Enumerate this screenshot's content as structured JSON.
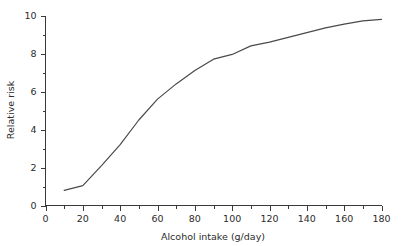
{
  "chart_data": {
    "type": "line",
    "title": "",
    "subtitle": "",
    "xlabel": "Alcohol intake (g/day)",
    "ylabel": "Relative risk",
    "xlim": [
      0,
      180
    ],
    "ylim": [
      0,
      10
    ],
    "grid": false,
    "legend": "none",
    "x_major_ticks": [
      0,
      20,
      40,
      60,
      80,
      100,
      120,
      140,
      160,
      180
    ],
    "x_minor_ticks": [
      10,
      30,
      50,
      70,
      90,
      110,
      130,
      150,
      170
    ],
    "y_major_ticks": [
      0,
      2,
      4,
      6,
      8,
      10
    ],
    "y_minor_ticks": [
      1,
      3,
      5,
      7,
      9
    ],
    "x_tick_labels": [
      "0",
      "20",
      "40",
      "60",
      "80",
      "100",
      "120",
      "140",
      "160",
      "180"
    ],
    "y_tick_labels": [
      "0",
      "2",
      "4",
      "6",
      "8",
      "10"
    ],
    "series": [
      {
        "name": "Relative risk",
        "color": "#4a4a4a",
        "x": [
          10,
          20,
          30,
          40,
          50,
          60,
          70,
          80,
          90,
          100,
          110,
          120,
          130,
          140,
          150,
          160,
          170,
          180
        ],
        "values": [
          0.8,
          1.05,
          2.1,
          3.2,
          4.5,
          5.6,
          6.4,
          7.1,
          7.7,
          7.95,
          8.4,
          8.6,
          8.85,
          9.1,
          9.35,
          9.55,
          9.72,
          9.8
        ]
      }
    ]
  },
  "axes": {
    "x_label": "Alcohol intake (g/day)",
    "y_label": "Relative risk"
  }
}
